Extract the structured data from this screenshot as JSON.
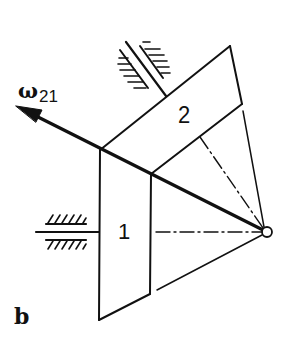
{
  "figure": {
    "panel_label": "b",
    "vector_label": {
      "symbol": "ω",
      "subscript": "21"
    },
    "parts": [
      {
        "id": "1",
        "label": "1",
        "name": "bevel gear 1"
      },
      {
        "id": "2",
        "label": "2",
        "name": "bevel gear 2"
      }
    ],
    "elements": [
      "angular velocity vector ω21 along the instantaneous axis of rotation",
      "fixed bearing for shaft of gear 1 (horizontal)",
      "fixed bearing for shaft of gear 2 (inclined)",
      "cone apex (common point of axes)",
      "dash-dot axes of gear 1 and gear 2"
    ],
    "colors": {
      "line": "#111111",
      "background": "#ffffff"
    }
  }
}
